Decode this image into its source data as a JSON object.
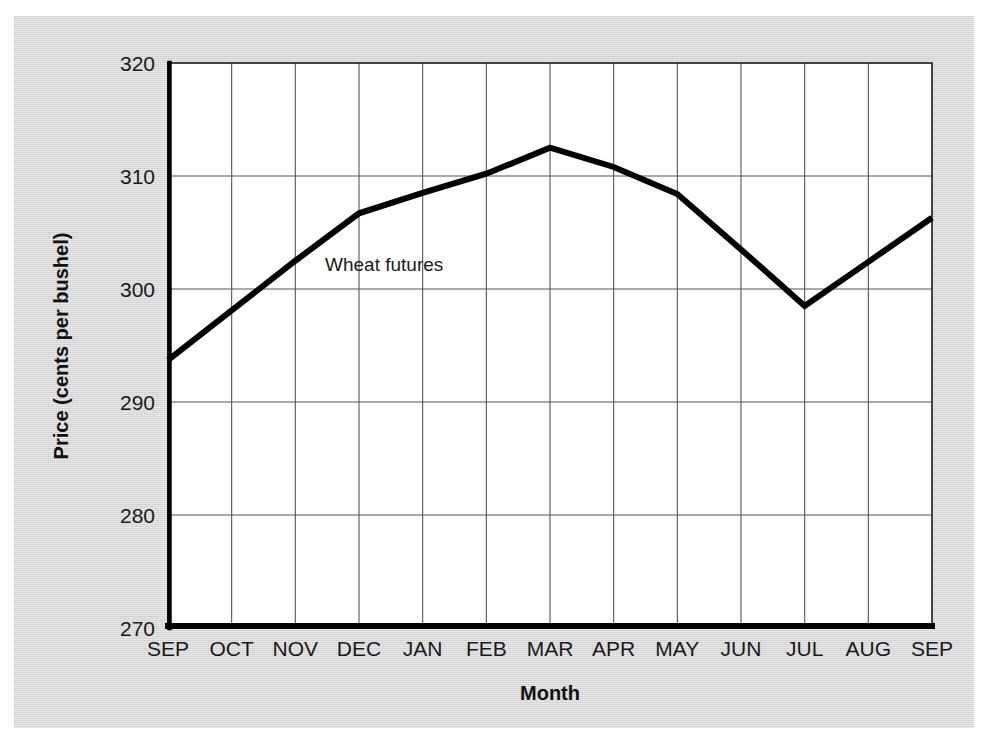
{
  "chart_data": {
    "type": "line",
    "title": "",
    "subtitle": "",
    "xlabel": "Month",
    "ylabel": "Price (cents per bushel)",
    "categories": [
      "SEP",
      "OCT",
      "NOV",
      "DEC",
      "JAN",
      "FEB",
      "MAR",
      "APR",
      "MAY",
      "JUN",
      "JUL",
      "AUG",
      "SEP"
    ],
    "series": [
      {
        "name": "Wheat futures",
        "values": [
          293.7,
          298.1,
          302.5,
          306.7,
          308.5,
          310.2,
          312.5,
          310.8,
          308.4,
          303.5,
          298.5,
          302.4,
          306.3
        ]
      }
    ],
    "ylim": [
      270,
      320
    ],
    "yticks": [
      270,
      280,
      290,
      300,
      310,
      320
    ],
    "ytick_labels": [
      "270",
      "280",
      "290",
      "300",
      "310",
      "320"
    ],
    "xlim_categories": [
      "SEP",
      "SEP"
    ],
    "grid": {
      "horizontal": true,
      "vertical": true,
      "color": "#555555"
    },
    "legend": {
      "position": "inline-annotation",
      "entries": [
        "Wheat futures"
      ]
    },
    "annotations": [
      {
        "text": "Wheat futures",
        "anchor_category": "NOV",
        "anchor_value": 302.0
      }
    ],
    "line_color": "#000000",
    "line_width": 6,
    "plot_background": "#ffffff",
    "figure_background": "#d9d9d9"
  },
  "axes": {
    "y_axis_title": "Price (cents per bushel)",
    "x_axis_title": "Month"
  }
}
